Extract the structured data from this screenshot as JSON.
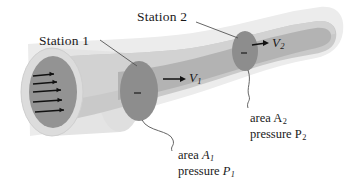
{
  "figure": {
    "type": "fluid-flow-streamtube-diagram",
    "background_color": "#ffffff"
  },
  "colors": {
    "outer_sheath": "#e9e9e9",
    "tube_body": "#c9c9c9",
    "tube_core": "#b4b4b4",
    "station_disc": "#8d8d8d",
    "inlet_disc": "#939393",
    "inlet_ring": "#dcdcdc",
    "line": "#4a4a4a",
    "text": "#1a1a1a",
    "arrow": "#111111"
  },
  "labels": {
    "station1": "Station 1",
    "station2": "Station 2",
    "velocity1": "V",
    "velocity1_sub": "1",
    "velocity2": "V",
    "velocity2_sub": "2",
    "area1_prefix": "area ",
    "area1_symbol": "A",
    "area1_sub": "1",
    "pressure1_prefix": "pressure ",
    "pressure1_symbol": "P",
    "pressure1_sub": "1",
    "area2_prefix": "area ",
    "area2_symbol": "A",
    "area2_sub": "2",
    "pressure2_prefix": "pressure ",
    "pressure2_symbol": "P",
    "pressure2_sub": "2"
  },
  "inlet": {
    "arrow_count": 5,
    "description": "uniform velocity profile arrows"
  },
  "stations": [
    {
      "name": "Station 1",
      "cx": 139,
      "cy": 91,
      "rx": 19,
      "ry": 30
    },
    {
      "name": "Station 2",
      "cx": 245,
      "cy": 51,
      "rx": 13,
      "ry": 20
    }
  ]
}
